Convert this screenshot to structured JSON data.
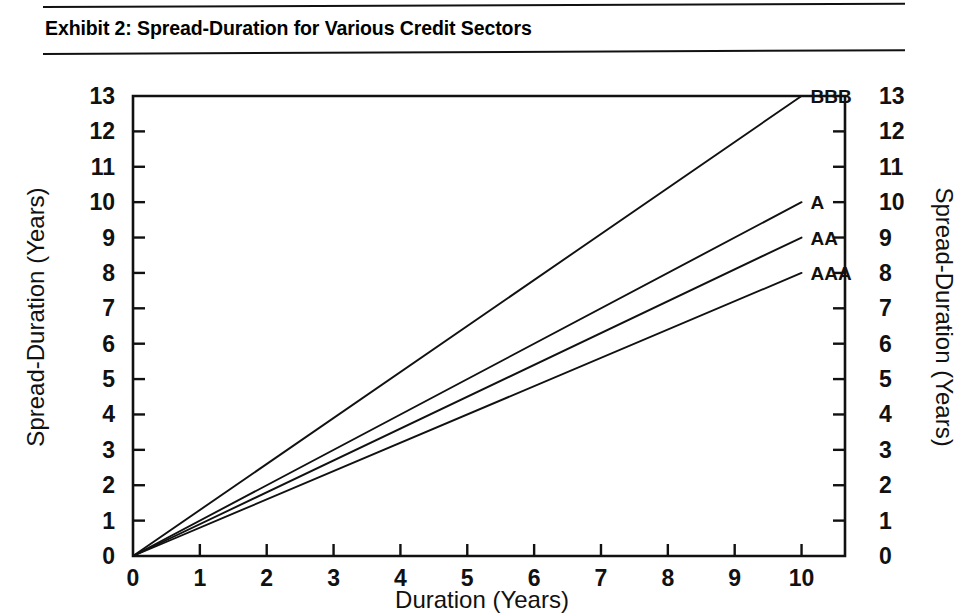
{
  "header": {
    "title": "Exhibit 2: Spread-Duration for Various Credit Sectors",
    "rule_color": "#111111"
  },
  "chart_data": {
    "type": "line",
    "title": "Exhibit 2: Spread-Duration for Various Credit Sectors",
    "xlabel": "Duration (Years)",
    "ylabel": "Spread-Duration (Years)",
    "ylabel_right": "Spread-Duration (Years)",
    "xlim": [
      0,
      10.65
    ],
    "ylim": [
      0,
      13
    ],
    "xticks": [
      0,
      1,
      2,
      3,
      4,
      5,
      6,
      7,
      8,
      9,
      10
    ],
    "yticks": [
      0,
      1,
      2,
      3,
      4,
      5,
      6,
      7,
      8,
      9,
      10,
      11,
      12,
      13
    ],
    "xtick_labels": [
      "0",
      "1",
      "2",
      "3",
      "4",
      "5",
      "6",
      "7",
      "8",
      "9",
      "10"
    ],
    "ytick_labels": [
      "0",
      "1",
      "2",
      "3",
      "4",
      "5",
      "6",
      "7",
      "8",
      "9",
      "10",
      "11",
      "12",
      "13"
    ],
    "ytick_labels_right": [
      "0",
      "1",
      "2",
      "3",
      "4",
      "5",
      "6",
      "7",
      "8",
      "9",
      "10",
      "11",
      "12",
      "13"
    ],
    "grid": false,
    "legend": "inline-right-end-labels",
    "line_color": "#111111",
    "series": [
      {
        "name": "BBB",
        "label": "BBB",
        "x": [
          0,
          10
        ],
        "values": [
          0,
          13
        ],
        "slope": 1.3
      },
      {
        "name": "A",
        "label": "A",
        "x": [
          0,
          10
        ],
        "values": [
          0,
          10
        ],
        "slope": 1.0
      },
      {
        "name": "AA",
        "label": "AA",
        "x": [
          0,
          10
        ],
        "values": [
          0,
          9
        ],
        "slope": 0.9
      },
      {
        "name": "AAA",
        "label": "AAA",
        "x": [
          0,
          10
        ],
        "values": [
          0,
          8
        ],
        "slope": 0.8
      }
    ]
  }
}
